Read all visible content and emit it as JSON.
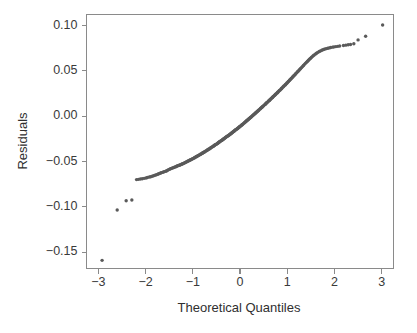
{
  "chart_data": {
    "type": "scatter",
    "title": "",
    "subtitle": "",
    "xlabel": "Theoretical Quantiles",
    "ylabel": "Residuals",
    "xlim": [
      -3.25,
      3.25
    ],
    "ylim": [
      -0.168,
      0.112
    ],
    "grid": false,
    "legend": null,
    "legend_position": "none",
    "xticks": [
      -3,
      -2,
      -1,
      0,
      1,
      2,
      3
    ],
    "xtick_labels": [
      "−3",
      "−2",
      "−1",
      "0",
      "1",
      "2",
      "3"
    ],
    "yticks": [
      0.1,
      0.05,
      0.0,
      -0.05,
      -0.1,
      -0.15
    ],
    "ytick_labels": [
      "0.10",
      "0.05",
      "0.00",
      "−0.05",
      "−0.10",
      "−0.15"
    ],
    "point_color": "#5a5a5a",
    "axis_color": "#8a8a8a",
    "text_color": "#3a3a3a",
    "background_color": "#ffffff",
    "marker": "circle",
    "marker_size": 1.7,
    "annotations": [],
    "series": [
      {
        "name": "Sample Quantiles",
        "x": [
          -2.92,
          -2.6,
          -2.41,
          -2.29,
          -2.19,
          -2.15,
          -2.11,
          -2.07,
          -2.03,
          -1.99,
          -1.96,
          -1.92,
          -1.89,
          -1.86,
          -1.83,
          -1.8,
          -1.77,
          -1.74,
          -1.72,
          -1.69,
          -1.67,
          -1.64,
          -1.62,
          -1.6,
          -1.57,
          -1.55,
          -1.53,
          -1.51,
          -1.49,
          -1.47,
          -1.45,
          -1.43,
          -1.41,
          -1.39,
          -1.37,
          -1.35,
          -1.34,
          -1.32,
          -1.3,
          -1.28,
          -1.27,
          -1.25,
          -1.23,
          -1.22,
          -1.2,
          -1.18,
          -1.17,
          -1.15,
          -1.14,
          -1.12,
          -1.11,
          -1.09,
          -1.08,
          -1.06,
          -1.05,
          -1.03,
          -1.02,
          -1.0,
          -0.99,
          -0.97,
          -0.96,
          -0.95,
          -0.93,
          -0.92,
          -0.91,
          -0.89,
          -0.88,
          -0.87,
          -0.85,
          -0.84,
          -0.83,
          -0.81,
          -0.8,
          -0.79,
          -0.78,
          -0.76,
          -0.75,
          -0.74,
          -0.73,
          -0.71,
          -0.7,
          -0.69,
          -0.68,
          -0.67,
          -0.65,
          -0.64,
          -0.63,
          -0.62,
          -0.61,
          -0.6,
          -0.58,
          -0.57,
          -0.56,
          -0.55,
          -0.54,
          -0.53,
          -0.52,
          -0.5,
          -0.49,
          -0.48,
          -0.47,
          -0.46,
          -0.45,
          -0.44,
          -0.43,
          -0.42,
          -0.4,
          -0.39,
          -0.38,
          -0.37,
          -0.36,
          -0.35,
          -0.34,
          -0.33,
          -0.32,
          -0.31,
          -0.3,
          -0.29,
          -0.28,
          -0.26,
          -0.25,
          -0.24,
          -0.23,
          -0.22,
          -0.21,
          -0.2,
          -0.19,
          -0.18,
          -0.17,
          -0.16,
          -0.15,
          -0.14,
          -0.13,
          -0.12,
          -0.11,
          -0.1,
          -0.09,
          -0.07,
          -0.06,
          -0.05,
          -0.04,
          -0.03,
          -0.02,
          -0.01,
          0.0,
          0.01,
          0.02,
          0.03,
          0.04,
          0.05,
          0.06,
          0.07,
          0.09,
          0.1,
          0.11,
          0.12,
          0.13,
          0.14,
          0.15,
          0.16,
          0.17,
          0.18,
          0.19,
          0.2,
          0.21,
          0.22,
          0.23,
          0.24,
          0.26,
          0.27,
          0.28,
          0.29,
          0.3,
          0.31,
          0.32,
          0.33,
          0.34,
          0.35,
          0.36,
          0.37,
          0.38,
          0.39,
          0.4,
          0.42,
          0.43,
          0.44,
          0.45,
          0.46,
          0.47,
          0.48,
          0.49,
          0.5,
          0.52,
          0.53,
          0.54,
          0.55,
          0.56,
          0.57,
          0.58,
          0.6,
          0.61,
          0.62,
          0.63,
          0.64,
          0.65,
          0.67,
          0.68,
          0.69,
          0.7,
          0.71,
          0.73,
          0.74,
          0.75,
          0.76,
          0.78,
          0.79,
          0.8,
          0.81,
          0.83,
          0.84,
          0.85,
          0.87,
          0.88,
          0.89,
          0.91,
          0.92,
          0.93,
          0.95,
          0.96,
          0.97,
          0.99,
          1.0,
          1.02,
          1.03,
          1.05,
          1.06,
          1.08,
          1.09,
          1.11,
          1.12,
          1.14,
          1.15,
          1.17,
          1.18,
          1.2,
          1.22,
          1.23,
          1.25,
          1.27,
          1.28,
          1.3,
          1.32,
          1.34,
          1.35,
          1.37,
          1.39,
          1.41,
          1.43,
          1.45,
          1.47,
          1.49,
          1.51,
          1.53,
          1.55,
          1.57,
          1.6,
          1.62,
          1.64,
          1.67,
          1.69,
          1.72,
          1.74,
          1.77,
          1.8,
          1.83,
          1.86,
          1.89,
          1.92,
          1.96,
          1.99,
          2.03,
          2.07,
          2.11,
          2.19,
          2.24,
          2.29,
          2.34,
          2.41,
          2.5,
          2.66,
          3.02
        ],
        "y": [
          -0.159,
          -0.1035,
          -0.0933,
          -0.0925,
          -0.07,
          -0.0697,
          -0.0694,
          -0.069,
          -0.0686,
          -0.0682,
          -0.0677,
          -0.0672,
          -0.0668,
          -0.0663,
          -0.0658,
          -0.0652,
          -0.0647,
          -0.0641,
          -0.0636,
          -0.063,
          -0.0625,
          -0.062,
          -0.0616,
          -0.0612,
          -0.0608,
          -0.0602,
          -0.0596,
          -0.059,
          -0.0585,
          -0.058,
          -0.0576,
          -0.0572,
          -0.0568,
          -0.0564,
          -0.056,
          -0.0556,
          -0.0552,
          -0.0548,
          -0.0545,
          -0.0542,
          -0.0538,
          -0.0534,
          -0.053,
          -0.0526,
          -0.0522,
          -0.0518,
          -0.0514,
          -0.051,
          -0.0506,
          -0.0502,
          -0.0498,
          -0.0494,
          -0.049,
          -0.0486,
          -0.0482,
          -0.0478,
          -0.0474,
          -0.047,
          -0.0466,
          -0.0462,
          -0.0458,
          -0.0454,
          -0.045,
          -0.0446,
          -0.0442,
          -0.0438,
          -0.0434,
          -0.043,
          -0.0426,
          -0.0422,
          -0.0418,
          -0.0414,
          -0.041,
          -0.0406,
          -0.0402,
          -0.0398,
          -0.0394,
          -0.039,
          -0.0386,
          -0.0382,
          -0.0378,
          -0.0374,
          -0.037,
          -0.0366,
          -0.0362,
          -0.0358,
          -0.0354,
          -0.035,
          -0.0346,
          -0.0342,
          -0.0338,
          -0.0334,
          -0.033,
          -0.0326,
          -0.0322,
          -0.0318,
          -0.0314,
          -0.031,
          -0.0306,
          -0.0302,
          -0.0298,
          -0.0294,
          -0.029,
          -0.0286,
          -0.0282,
          -0.0278,
          -0.0273,
          -0.0269,
          -0.0265,
          -0.0261,
          -0.0257,
          -0.0253,
          -0.0249,
          -0.0245,
          -0.0241,
          -0.0237,
          -0.0233,
          -0.0229,
          -0.0225,
          -0.022,
          -0.0216,
          -0.0212,
          -0.0208,
          -0.0204,
          -0.02,
          -0.0196,
          -0.0192,
          -0.0188,
          -0.0183,
          -0.0179,
          -0.0175,
          -0.0171,
          -0.0167,
          -0.0163,
          -0.0158,
          -0.0154,
          -0.015,
          -0.0144,
          -0.014,
          -0.0136,
          -0.0131,
          -0.0127,
          -0.0123,
          -0.0118,
          -0.0114,
          -0.011,
          -0.0105,
          -0.0101,
          -0.0097,
          -0.0092,
          -0.0088,
          -0.0083,
          -0.0075,
          -0.007,
          -0.0066,
          -0.0061,
          -0.0057,
          -0.0052,
          -0.0048,
          -0.0043,
          -0.0039,
          -0.0034,
          -0.003,
          -0.0025,
          -0.0021,
          -0.0016,
          -0.0012,
          -0.0007,
          0.0002,
          0.0006,
          0.0011,
          0.0016,
          0.002,
          0.0025,
          0.003,
          0.0034,
          0.0039,
          0.0044,
          0.0048,
          0.0053,
          0.0058,
          0.0062,
          0.0067,
          0.0077,
          0.0081,
          0.0086,
          0.0091,
          0.0096,
          0.01,
          0.0105,
          0.011,
          0.0115,
          0.0124,
          0.0129,
          0.0134,
          0.0139,
          0.0144,
          0.0149,
          0.0153,
          0.0163,
          0.0168,
          0.0173,
          0.0178,
          0.0183,
          0.0188,
          0.0198,
          0.0203,
          0.0208,
          0.0213,
          0.0218,
          0.0228,
          0.0233,
          0.0238,
          0.0243,
          0.0253,
          0.0258,
          0.0263,
          0.0268,
          0.0279,
          0.0284,
          0.0289,
          0.0299,
          0.0304,
          0.031,
          0.032,
          0.0325,
          0.0331,
          0.0341,
          0.0346,
          0.0352,
          0.0362,
          0.0368,
          0.0378,
          0.0384,
          0.0395,
          0.04,
          0.0411,
          0.0417,
          0.0428,
          0.0433,
          0.0444,
          0.045,
          0.0461,
          0.0467,
          0.0478,
          0.0489,
          0.0495,
          0.0506,
          0.0518,
          0.0523,
          0.0534,
          0.0545,
          0.0556,
          0.0562,
          0.0573,
          0.0584,
          0.0595,
          0.0605,
          0.0616,
          0.0626,
          0.0636,
          0.0646,
          0.0656,
          0.0665,
          0.0674,
          0.0685,
          0.0693,
          0.07,
          0.0709,
          0.0715,
          0.0722,
          0.0728,
          0.0734,
          0.0739,
          0.0744,
          0.0748,
          0.0752,
          0.0756,
          0.076,
          0.0763,
          0.0766,
          0.0769,
          0.0772,
          0.0778,
          0.0782,
          0.0786,
          0.079,
          0.0797,
          0.084,
          0.088,
          0.1005
        ]
      }
    ]
  },
  "axes": {
    "x_axis_name": "theoretical-quantiles-axis",
    "y_axis_name": "residuals-axis"
  }
}
